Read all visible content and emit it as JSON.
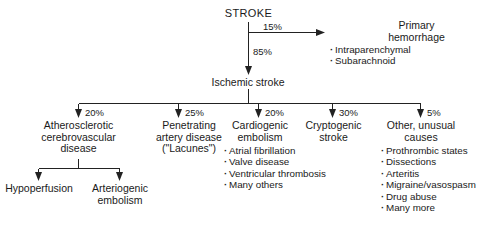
{
  "figure": {
    "root": {
      "label": "STROKE"
    },
    "hemorrhage_branch": {
      "percent": "15%",
      "title_line1": "Primary",
      "title_line2": "hemorrhage",
      "bullets": [
        "Intraparenchymal",
        "Subarachnoid"
      ]
    },
    "ischemic_branch": {
      "percent": "85%",
      "label": "Ischemic stroke"
    },
    "subtypes": [
      {
        "percent": "20%",
        "title_lines": [
          "Atherosclerotic",
          "cerebrovascular",
          "disease"
        ],
        "bullets": [],
        "children": [
          {
            "label_lines": [
              "Hypoperfusion"
            ]
          },
          {
            "label_lines": [
              "Arteriogenic",
              "embolism"
            ]
          }
        ]
      },
      {
        "percent": "25%",
        "title_lines": [
          "Penetrating",
          "artery disease",
          "(\"Lacunes\")"
        ],
        "bullets": [],
        "children": []
      },
      {
        "percent": "20%",
        "title_lines": [
          "Cardiogenic",
          "embolism"
        ],
        "bullets": [
          "Atrial fibrillation",
          "Valve disease",
          "Ventricular thrombosis",
          "Many others"
        ],
        "children": []
      },
      {
        "percent": "30%",
        "title_lines": [
          "Cryptogenic",
          "stroke"
        ],
        "bullets": [],
        "children": []
      },
      {
        "percent": "5%",
        "title_lines": [
          "Other, unusual",
          "causes"
        ],
        "bullets": [
          "Prothrombic states",
          "Dissections",
          "Arteritis",
          "Migraine/vasospasm",
          "Drug abuse",
          "Many more"
        ],
        "children": []
      }
    ]
  }
}
